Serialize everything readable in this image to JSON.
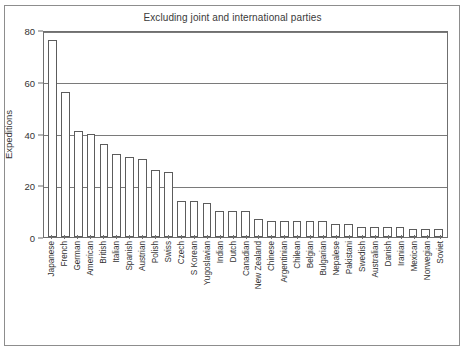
{
  "chart_data": {
    "type": "bar",
    "title": "Excluding joint and international parties",
    "xlabel": "",
    "ylabel": "Expeditions",
    "ylim": [
      0,
      80
    ],
    "yticks": [
      0,
      20,
      40,
      60,
      80
    ],
    "grid": true,
    "legend": false,
    "categories": [
      "Japanese",
      "French",
      "German",
      "American",
      "British",
      "Italian",
      "Spanish",
      "Austrian",
      "Polish",
      "Swiss",
      "Czech",
      "S Korean",
      "Yugoslavian",
      "Indian",
      "Dutch",
      "Canadian",
      "New Zealand",
      "Chinese",
      "Argentinian",
      "Chilean",
      "Belgian",
      "Bulgarian",
      "Nepalese",
      "Pakistani",
      "Swedish",
      "Australian",
      "Danish",
      "Iranian",
      "Mexican",
      "Norwegian",
      "Soviet"
    ],
    "values": [
      76,
      56,
      41,
      40,
      36,
      32,
      31,
      30,
      26,
      25,
      14,
      14,
      13,
      10,
      10,
      10,
      7,
      6,
      6,
      6,
      6,
      6,
      5,
      5,
      4,
      4,
      4,
      4,
      3,
      3,
      3
    ]
  },
  "figure": {
    "bar_fill": "#ffffff",
    "bar_stroke": "#5c5c5c",
    "grid_color": "#7a7a7a",
    "frame_color": "#8d8d8d",
    "axis_color": "#6f6f6f",
    "text_color": "#333333",
    "background": "#ffffff"
  }
}
